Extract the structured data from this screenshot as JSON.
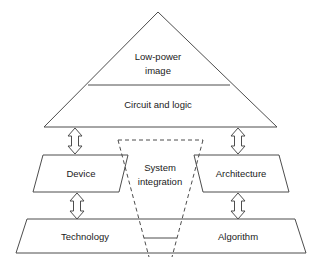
{
  "diagram": {
    "background_color": "#ffffff",
    "stroke_color": "#4d4d4d",
    "text_color": "#1a1a1a",
    "pyramid": {
      "apex_label_line1": "Low-power",
      "apex_label_line2": "image",
      "second_tier_label": "Circuit and logic"
    },
    "middle_row": {
      "left_label": "Device",
      "right_label": "Architecture"
    },
    "center_wedge": {
      "label_line1": "System",
      "label_line2": "integration",
      "border_style": "dashed"
    },
    "bottom_row": {
      "left_label": "Technology",
      "right_label": "Algorithm"
    },
    "connectors": [
      {
        "name": "arrow-pyramid-to-device",
        "icon": "double-headed-vertical-arrow-icon"
      },
      {
        "name": "arrow-pyramid-to-architecture",
        "icon": "double-headed-vertical-arrow-icon"
      },
      {
        "name": "arrow-device-to-technology",
        "icon": "double-headed-vertical-arrow-icon"
      },
      {
        "name": "arrow-architecture-to-algorithm",
        "icon": "double-headed-vertical-arrow-icon"
      }
    ]
  }
}
